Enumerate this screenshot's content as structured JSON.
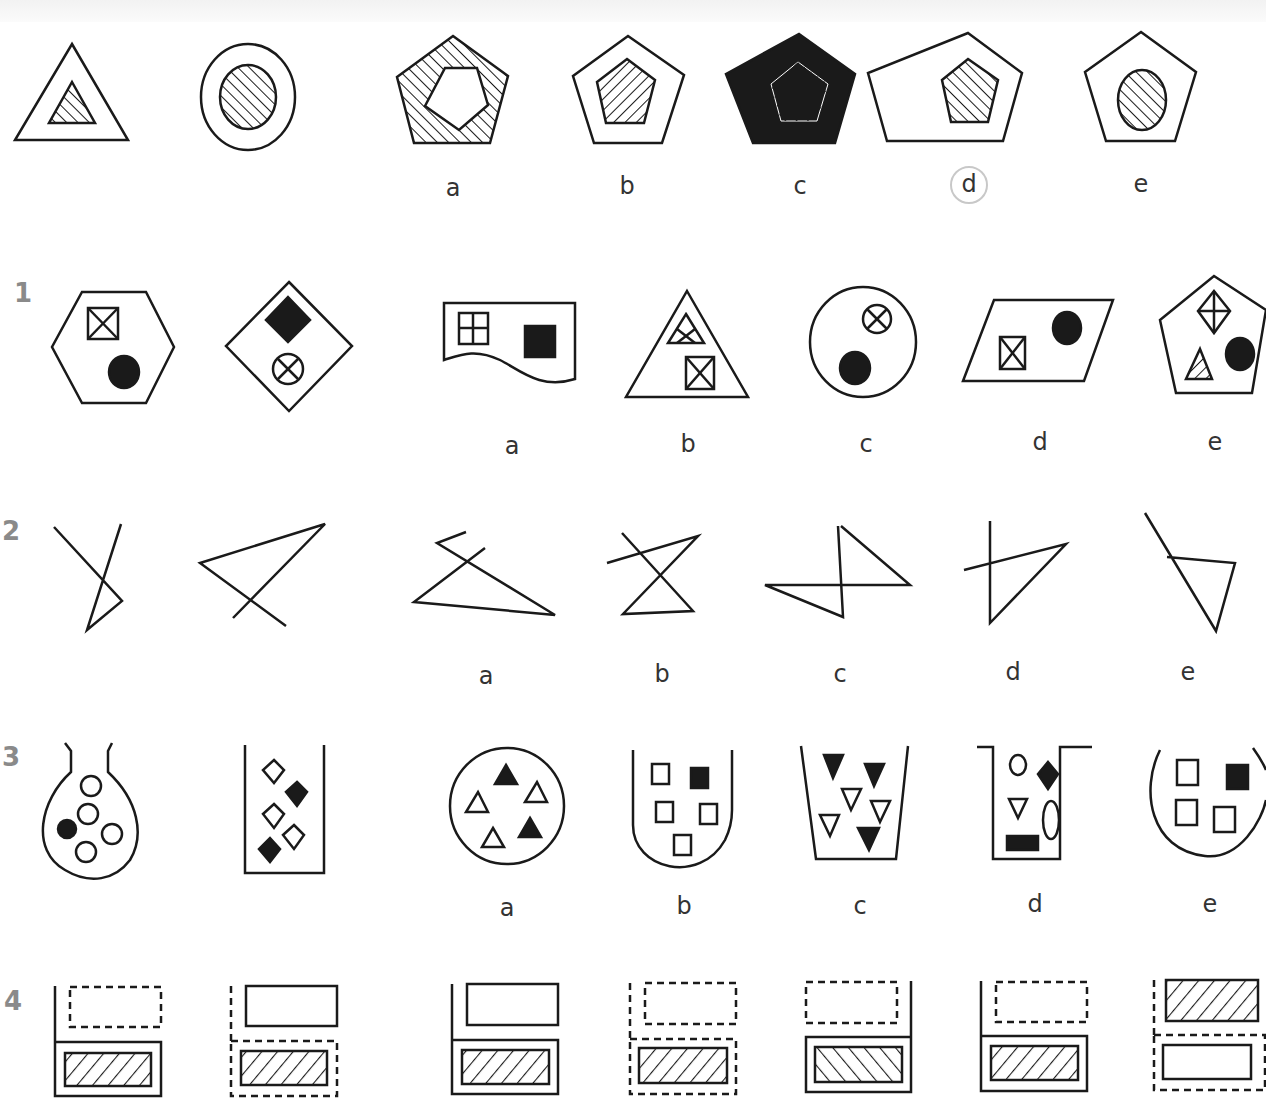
{
  "header": {
    "note": ""
  },
  "example": {
    "row_label": "",
    "description": "Triangle with smaller hatched triangle inside is to circle with hatched circle inside, as pentagon is to ...",
    "options": [
      {
        "label": "a",
        "description": "pentagon with rotated inner pentagon, outer band hatched"
      },
      {
        "label": "b",
        "description": "pentagon with hatched inner pentagon"
      },
      {
        "label": "c",
        "description": "solid black pentagon with hatched inner pentagon"
      },
      {
        "label": "d",
        "description": "pentagon with hatched inner pentagon",
        "selected": true
      },
      {
        "label": "e",
        "description": "pentagon with hatched circle inside"
      }
    ]
  },
  "questions": [
    {
      "number": "1",
      "options": [
        {
          "label": "a",
          "description": "wavy-bottom rectangle with grid square and black square"
        },
        {
          "label": "b",
          "description": "triangle with crossed triangle and crossed square"
        },
        {
          "label": "c",
          "description": "circle with crossed circle and black circle"
        },
        {
          "label": "d",
          "description": "parallelogram with crossed square and black circle"
        },
        {
          "label": "e",
          "description": "pentagon with crossed diamond, hatched triangle and black circle"
        }
      ]
    },
    {
      "number": "2",
      "options": [
        {
          "label": "a",
          "description": "zigzag line figure"
        },
        {
          "label": "b",
          "description": "crossed hourglass line figure"
        },
        {
          "label": "c",
          "description": "Z-shaped line figure"
        },
        {
          "label": "d",
          "description": "cross with triangle line figure"
        },
        {
          "label": "e",
          "description": "line with attached triangle"
        }
      ]
    },
    {
      "number": "3",
      "options": [
        {
          "label": "a",
          "description": "circle with 3 white and 2 black triangles"
        },
        {
          "label": "b",
          "description": "U-shaped tube with 4 white and 1 black square"
        },
        {
          "label": "c",
          "description": "beaker with 3 white and 3 black inverted triangles"
        },
        {
          "label": "d",
          "description": "flanged container with mixed shapes"
        },
        {
          "label": "e",
          "description": "open circle with 3 white and 1 black square"
        }
      ]
    },
    {
      "number": "4",
      "options": [
        {
          "label": "a",
          "description": "solid frame, solid top box, hatched inner box"
        },
        {
          "label": "b",
          "description": "dashed frame, dashed top box, hatched inner box"
        },
        {
          "label": "c",
          "description": "solid frame mirrored, dashed top box, back-hatched inner box"
        },
        {
          "label": "d",
          "description": "solid frame, dashed top box, hatched inner box"
        },
        {
          "label": "e",
          "description": "dashed frame, hatched top box, white inner box"
        }
      ]
    }
  ],
  "colors": {
    "ink": "#1a1a1a",
    "label": "#333333",
    "row_number": "#8a8a8a",
    "selection_ring": "#c8c8c8"
  }
}
